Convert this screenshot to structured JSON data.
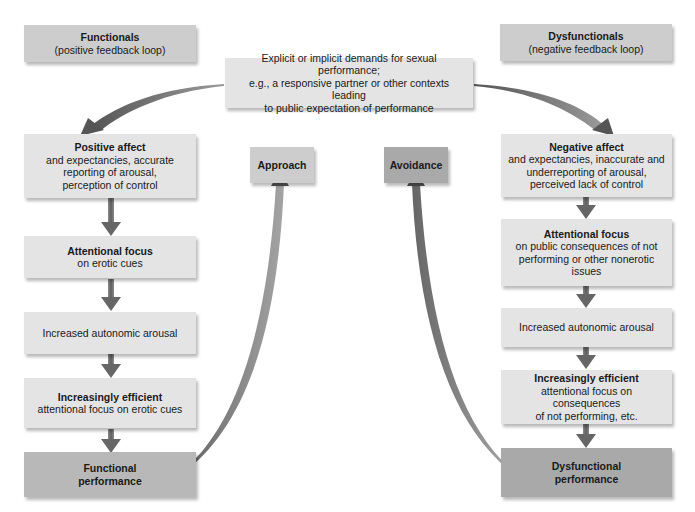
{
  "header": {
    "left": {
      "title": "Functionals",
      "subtitle": "(positive feedback loop)"
    },
    "right": {
      "title": "Dysfunctionals",
      "subtitle": "(negative feedback loop)"
    },
    "center": {
      "lines": [
        "Explicit or implicit demands for sexual performance;",
        "e.g., a responsive partner or other contexts leading",
        "to public expectation of performance"
      ]
    }
  },
  "middle": {
    "approach": "Approach",
    "avoidance": "Avoidance"
  },
  "left_column": [
    {
      "title": "Positive affect",
      "lines": [
        "and expectancies, accurate",
        "reporting of arousal,",
        "perception of control"
      ]
    },
    {
      "title": "Attentional focus",
      "lines": [
        "on erotic cues"
      ]
    },
    {
      "title": "",
      "lines": [
        "Increased autonomic arousal"
      ]
    },
    {
      "title": "Increasingly efficient",
      "lines": [
        "attentional focus on erotic cues"
      ]
    },
    {
      "title": "Functional",
      "lines": [
        "performance"
      ]
    }
  ],
  "right_column": [
    {
      "title": "Negative affect",
      "lines": [
        "and expectancies, inaccurate and",
        "underreporting of arousal,",
        "perceived lack of control"
      ]
    },
    {
      "title": "Attentional focus",
      "lines": [
        "on public consequences of not",
        "performing or other nonerotic",
        "issues"
      ]
    },
    {
      "title": "",
      "lines": [
        "Increased autonomic arousal"
      ]
    },
    {
      "title": "Increasingly efficient",
      "lines": [
        "attentional focus on consequences",
        "of not performing, etc."
      ]
    },
    {
      "title": "Dysfunctional",
      "lines": [
        "performance"
      ]
    }
  ],
  "colors": {
    "box_light": "#e4e4e4",
    "box_mid": "#cdcdcd",
    "box_dark": "#b8b8b8",
    "arrow": "#6e6e6e"
  }
}
